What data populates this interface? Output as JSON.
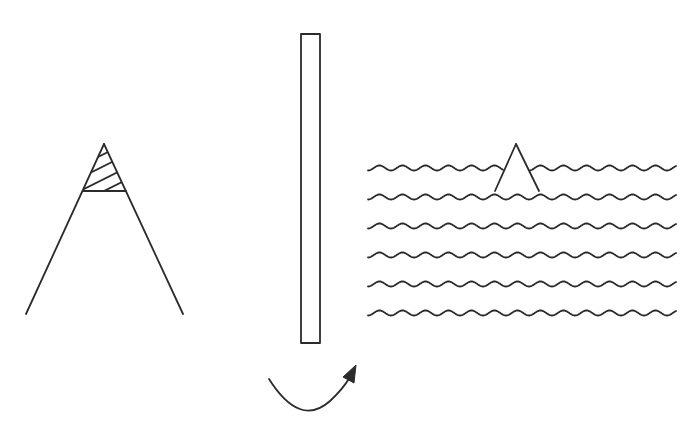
{
  "diagram": {
    "colors": {
      "background": "#ffffff",
      "stroke": "#2b2b2b"
    },
    "panels": [
      {
        "id": "cone",
        "label": "",
        "apex": [
          104,
          144
        ],
        "crossbar_y": 191,
        "crossbar_x": [
          83,
          126
        ],
        "base_left": [
          26,
          314
        ],
        "base_right": [
          183,
          314
        ],
        "hatch_lines": 4
      },
      {
        "id": "bar",
        "label": "",
        "rect": {
          "x": 301,
          "y": 34,
          "width": 19,
          "height": 309
        },
        "arrow": {
          "start": [
            269,
            379
          ],
          "control": [
            305,
            440
          ],
          "end": [
            356,
            366
          ],
          "direction": "clockwise-up-right"
        }
      },
      {
        "id": "water",
        "label": "",
        "wave_x_range": [
          368,
          676
        ],
        "wave_rows_y": [
          168,
          197,
          226,
          255,
          284,
          313
        ],
        "wavelength": 23,
        "amplitude": 2.5,
        "tip": {
          "apex": [
            516,
            144
          ],
          "left": [
            495,
            191
          ],
          "right": [
            539,
            191
          ]
        },
        "gap_in_first_wave": [
          503,
          530
        ]
      }
    ]
  }
}
